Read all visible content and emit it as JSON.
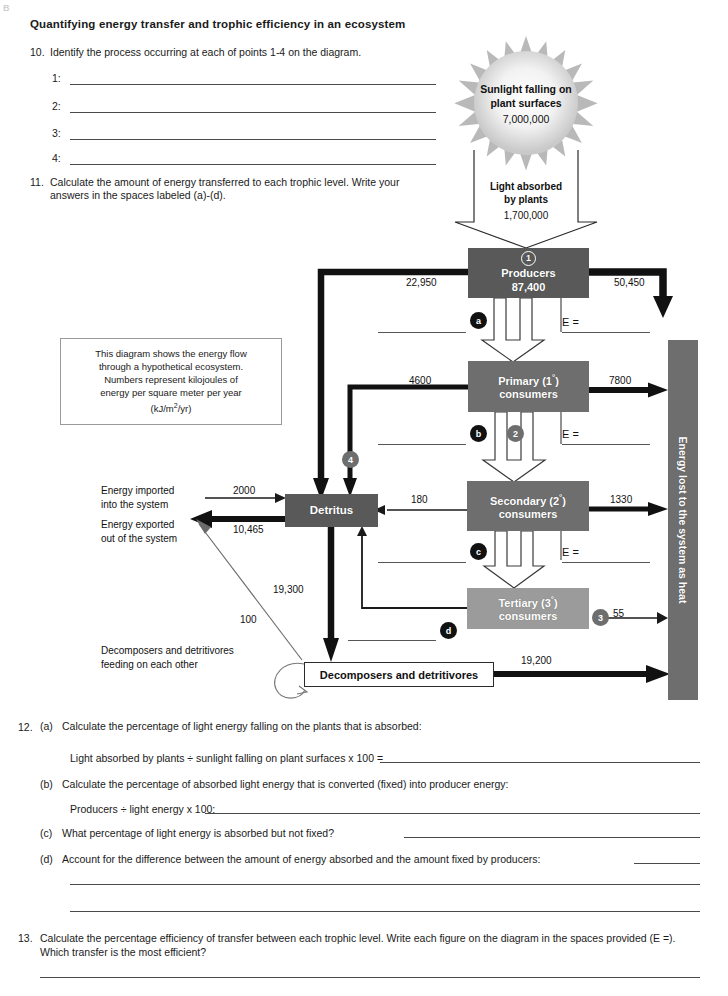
{
  "page": {
    "corner_mark": "B",
    "title": "Quantifying energy transfer and trophic efficiency in an ecosystem"
  },
  "q10": {
    "number": "10.",
    "text": "Identify the process occurring at each of points 1-4 on the diagram.",
    "blanks": [
      "1:",
      "2:",
      "3:",
      "4:"
    ]
  },
  "q11": {
    "number": "11.",
    "text": "Calculate the amount of energy transferred to each trophic level. Write your answers in the spaces labeled (a)-(d)."
  },
  "caption": {
    "line1": "This diagram shows the energy flow",
    "line2": "through a hypothetical ecosystem.",
    "line3": "Numbers represent kilojoules of",
    "line4": "energy per square meter per year",
    "line5_pre": "(kJ/m",
    "line5_sup": "2",
    "line5_post": "/yr)"
  },
  "diagram": {
    "sun": {
      "label_line1": "Sunlight falling on",
      "label_line2": "plant surfaces",
      "value": "7,000,000"
    },
    "light_absorbed": {
      "label_line1": "Light absorbed",
      "label_line2": "by plants",
      "value": "1,700,000"
    },
    "boxes": {
      "producers": {
        "name": "Producers",
        "value": "87,400",
        "marker": "1"
      },
      "primary": {
        "name_pre": "Primary (1",
        "name_sup": "°",
        "name_post": ")",
        "name_line2": "consumers"
      },
      "secondary": {
        "name_pre": "Secondary (2",
        "name_sup": "°",
        "name_post": ")",
        "name_line2": "consumers"
      },
      "tertiary": {
        "name_pre": "Tertiary (3",
        "name_sup": "°",
        "name_post": ")",
        "name_line2": "consumers"
      },
      "detritus": {
        "name": "Detritus"
      },
      "decomposers": {
        "name": "Decomposers and detritivores"
      }
    },
    "energy_bar": {
      "label": "Energy lost to the system as heat"
    },
    "flow_values": {
      "producers_to_detritus": "22,950",
      "producers_to_heat": "50,450",
      "primary_to_detritus": "4600",
      "primary_to_heat": "7800",
      "secondary_to_detritus": "180",
      "secondary_to_heat": "1330",
      "tertiary_to_heat": "55",
      "detritus_to_decomposers": "19,300",
      "decomposers_to_heat": "19,200",
      "imported": "2000",
      "exported": "10,465",
      "decomposer_export": "100"
    },
    "side_labels": {
      "imported_line1": "Energy imported",
      "imported_line2": "into the system",
      "exported_line1": "Energy exported",
      "exported_line2": "out of the system",
      "feeding_line1": "Decomposers and detritivores",
      "feeding_line2": "feeding on each other"
    },
    "markers": {
      "a": "a",
      "b": "b",
      "c": "c",
      "d": "d",
      "n1": "1",
      "n2": "2",
      "n3": "3",
      "n4": "4"
    },
    "efficiency_label": "E ="
  },
  "q12": {
    "number": "12.",
    "a_tag": "(a)",
    "a_text": "Calculate the percentage of light energy falling on the plants that is absorbed:",
    "a_formula": "Light absorbed by plants  ÷  sunlight falling on plant surfaces  x 100   =",
    "b_tag": "(b)",
    "b_text": "Calculate the percentage of absorbed light energy that is converted (fixed) into producer energy:",
    "b_formula": "Producers ÷ light energy x 100:",
    "c_tag": "(c)",
    "c_text": "What percentage of light energy is absorbed but not fixed?",
    "d_tag": "(d)",
    "d_text": "Account for the difference between the amount of energy absorbed and the amount fixed by producers:"
  },
  "q13": {
    "number": "13.",
    "text": "Calculate the percentage efficiency of transfer between each trophic level. Write each figure on the diagram in the spaces provided (E =). Which transfer is the most efficient?"
  }
}
